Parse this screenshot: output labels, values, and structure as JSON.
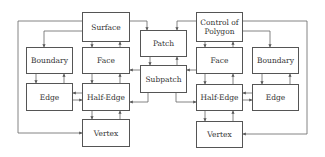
{
  "diagram": {
    "left": {
      "surface": "Surface",
      "boundary": "Boundary",
      "face": "Face",
      "edge": "Edge",
      "half_edge": "Half-Edge",
      "vertex": "Vertex"
    },
    "center": {
      "patch": "Patch",
      "subpatch": "Subpatch"
    },
    "right": {
      "control_polygon": "Control of Polygon",
      "face": "Face",
      "boundary": "Boundary",
      "half_edge": "Half-Edge",
      "edge": "Edge",
      "vertex": "Vertex"
    }
  }
}
